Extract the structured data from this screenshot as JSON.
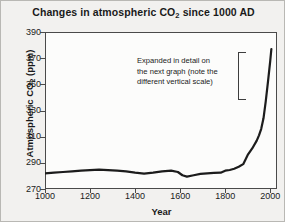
{
  "chart_data": {
    "type": "line",
    "title": "Changes in atmospheric CO2 since 1000 AD",
    "title_pre": "Changes in atmospheric CO",
    "title_sub": "2",
    "title_post": " since 1000 AD",
    "xlabel": "Year",
    "ylabel": "Atmospheric CO2 (ppm)",
    "ylabel_pre": "Atmospheric CO",
    "ylabel_sub": "2",
    "ylabel_post": " (ppm)",
    "xlim": [
      1000,
      2030
    ],
    "ylim": [
      270,
      390
    ],
    "grid": false,
    "legend": "none",
    "line_color": "#1c1c1c",
    "line_width": 2.2,
    "xticks": [
      1000,
      1200,
      1400,
      1600,
      1800,
      2000
    ],
    "xtick_labels": [
      "1000",
      "1200",
      "1400",
      "1600",
      "1800",
      "2000"
    ],
    "yticks": [
      270,
      290,
      310,
      330,
      350,
      370,
      390
    ],
    "ytick_labels": [
      "270",
      "290",
      "310",
      "330",
      "350",
      "370",
      "390"
    ],
    "annotation": "Expanded in detail on the next graph (note the different vertical scale)",
    "annotation_lines": [
      "Expanded in detail on",
      "the next graph (note the",
      "different vertical scale)"
    ],
    "annotation_bracket": {
      "x_year": 1855,
      "y_top_ppm": 375,
      "y_bottom_ppm": 338
    },
    "x": [
      1000,
      1040,
      1080,
      1120,
      1160,
      1200,
      1240,
      1280,
      1320,
      1360,
      1400,
      1440,
      1480,
      1520,
      1560,
      1590,
      1610,
      1630,
      1660,
      1690,
      1720,
      1750,
      1780,
      1800,
      1820,
      1840,
      1860,
      1880,
      1900,
      1920,
      1940,
      1950,
      1960,
      1970,
      1980,
      1990,
      2000,
      2005
    ],
    "y": [
      282,
      282.5,
      283,
      283.5,
      284,
      284.5,
      284.8,
      284.5,
      284,
      283.5,
      282.5,
      281.8,
      282.5,
      283.5,
      284,
      283,
      280.5,
      279.5,
      280.5,
      281.5,
      282,
      282.3,
      282.5,
      284,
      284.5,
      285.5,
      287,
      289,
      296,
      301,
      307,
      311,
      316,
      324,
      337,
      352,
      368,
      377
    ]
  }
}
